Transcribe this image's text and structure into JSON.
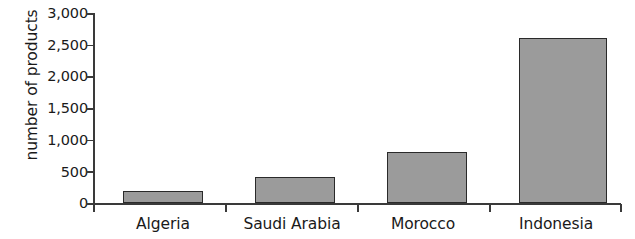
{
  "chart_data": {
    "type": "bar",
    "title": "",
    "subtitle": "",
    "xlabel": "",
    "ylabel": "number of products",
    "categories": [
      "Algeria",
      "Saudi Arabia",
      "Morocco",
      "Indonesia"
    ],
    "values": [
      190,
      410,
      810,
      2600
    ],
    "series": [
      {
        "name": "number of products",
        "values": [
          190,
          410,
          810,
          2600
        ]
      }
    ],
    "ylim": [
      0,
      3000
    ],
    "y_ticks": [
      0,
      500,
      1000,
      1500,
      2000,
      2500,
      3000
    ],
    "y_tick_labels": [
      "0",
      "500",
      "1,000",
      "1,500",
      "2,000",
      "2,500",
      "3,000"
    ],
    "grid": false,
    "legend": false,
    "legend_position": "none",
    "bar_color": "#9b9b9b",
    "bar_border_color": "#2a2a2a",
    "axis_color": "#3a3a3a",
    "background_color": "#ffffff"
  }
}
